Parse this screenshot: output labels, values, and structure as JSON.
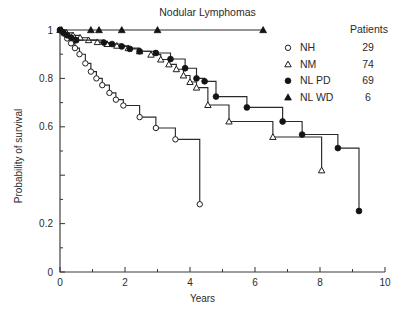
{
  "chart_data": {
    "type": "line",
    "title": "Nodular Lymphomas",
    "xlabel": "Years",
    "ylabel": "Probability of survival",
    "xlim": [
      0,
      10
    ],
    "ylim": [
      0,
      1
    ],
    "grid": false,
    "legend_position": "top-right",
    "x_ticks_major": [
      0,
      2,
      4,
      6,
      8,
      10
    ],
    "x_ticks_minor": [
      1,
      3,
      5,
      7,
      9
    ],
    "x_tick_labels": [
      "0",
      "2",
      "4",
      "6",
      "8",
      "10"
    ],
    "y_ticks_major": [
      0,
      0.2,
      0.4,
      0.6,
      0.8,
      1
    ],
    "y_ticks_minor": [
      0.1,
      0.3,
      0.5,
      0.7,
      0.9
    ],
    "y_tick_labels": [
      "0",
      "0.2",
      "",
      "0.6",
      "0.8",
      "1"
    ],
    "legend_header": "Patients",
    "series": [
      {
        "name": "NH",
        "label": "NH",
        "patients": "29",
        "marker": "open-circle",
        "points": [
          [
            0.0,
            1.0
          ],
          [
            0.12,
            0.985
          ],
          [
            0.22,
            0.965
          ],
          [
            0.34,
            0.945
          ],
          [
            0.46,
            0.925
          ],
          [
            0.6,
            0.9
          ],
          [
            0.78,
            0.862
          ],
          [
            0.95,
            0.828
          ],
          [
            1.12,
            0.8
          ],
          [
            1.3,
            0.772
          ],
          [
            1.52,
            0.74
          ],
          [
            1.72,
            0.712
          ],
          [
            1.95,
            0.688
          ],
          [
            2.45,
            0.64
          ],
          [
            2.95,
            0.595
          ],
          [
            3.55,
            0.548
          ],
          [
            4.3,
            0.28
          ]
        ]
      },
      {
        "name": "NM",
        "label": "NM",
        "patients": "74",
        "marker": "open-triangle",
        "points": [
          [
            0.0,
            1.0
          ],
          [
            0.2,
            0.988
          ],
          [
            0.4,
            0.978
          ],
          [
            0.62,
            0.968
          ],
          [
            0.88,
            0.958
          ],
          [
            1.15,
            0.95
          ],
          [
            1.45,
            0.942
          ],
          [
            1.75,
            0.935
          ],
          [
            2.1,
            0.925
          ],
          [
            2.45,
            0.912
          ],
          [
            2.8,
            0.898
          ],
          [
            3.1,
            0.878
          ],
          [
            3.35,
            0.858
          ],
          [
            3.58,
            0.838
          ],
          [
            3.8,
            0.812
          ],
          [
            4.0,
            0.785
          ],
          [
            4.2,
            0.762
          ],
          [
            4.55,
            0.69
          ],
          [
            5.2,
            0.622
          ],
          [
            6.55,
            0.558
          ],
          [
            8.05,
            0.42
          ]
        ]
      },
      {
        "name": "NL PD",
        "label": "NL PD",
        "patients": "69",
        "marker": "filled-circle",
        "points": [
          [
            0.0,
            1.0
          ],
          [
            0.1,
            0.99
          ],
          [
            0.22,
            0.978
          ],
          [
            0.35,
            0.968
          ],
          [
            0.5,
            0.958
          ],
          [
            1.35,
            0.948
          ],
          [
            1.6,
            0.942
          ],
          [
            1.9,
            0.932
          ],
          [
            2.15,
            0.922
          ],
          [
            2.45,
            0.912
          ],
          [
            2.95,
            0.905
          ],
          [
            3.4,
            0.88
          ],
          [
            3.85,
            0.842
          ],
          [
            4.2,
            0.8
          ],
          [
            4.45,
            0.788
          ],
          [
            4.8,
            0.725
          ],
          [
            5.75,
            0.68
          ],
          [
            6.85,
            0.622
          ],
          [
            7.45,
            0.568
          ],
          [
            8.55,
            0.512
          ],
          [
            9.2,
            0.252
          ]
        ]
      },
      {
        "name": "NL WD",
        "label": "NL WD",
        "patients": "6",
        "marker": "filled-triangle",
        "points": [
          [
            0.05,
            1.0
          ],
          [
            0.95,
            1.0
          ],
          [
            1.2,
            1.0
          ],
          [
            1.9,
            1.0
          ],
          [
            3.0,
            1.0
          ],
          [
            6.25,
            1.0
          ]
        ]
      }
    ]
  }
}
